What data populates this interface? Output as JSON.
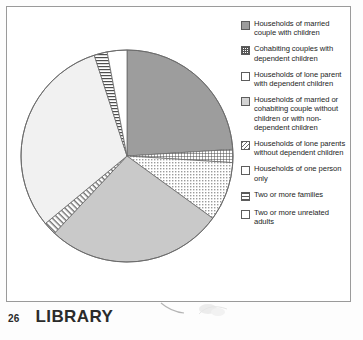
{
  "footer": {
    "page_number": "26",
    "section_title": "LIBRARY"
  },
  "legend": {
    "items": [
      {
        "pattern": "solid-dark",
        "icon": "solid-dark-swatch",
        "label": "Households of married couple with children"
      },
      {
        "pattern": "crosshatch",
        "icon": "crosshatch-swatch",
        "label": "Cohabiting couples with dependent children"
      },
      {
        "pattern": "dots",
        "icon": "dotted-swatch",
        "label": "Households of lone parent with dependent children"
      },
      {
        "pattern": "solid-light",
        "icon": "solid-light-swatch",
        "label": "Households of married or cohabiting couple without children or with non-dependent children"
      },
      {
        "pattern": "diagonal",
        "icon": "diagonal-hatch-swatch",
        "label": "Households of lone parents without dependent children"
      },
      {
        "pattern": "empty",
        "icon": "empty-swatch",
        "label": "Households of one person only"
      },
      {
        "pattern": "hstripe",
        "icon": "horizontal-stripe-swatch",
        "label": "Two or more families"
      },
      {
        "pattern": "empty",
        "icon": "empty-swatch",
        "label": "Two or more unrelated adults"
      }
    ]
  },
  "chart_data": {
    "type": "pie",
    "title": "",
    "legend_position": "right",
    "start_angle_deg": 0,
    "direction": "clockwise",
    "categories": [
      "Households of married couple with children",
      "Cohabiting couples with dependent children",
      "Households of lone parent with dependent children",
      "Households of married or cohabiting couple without children or with non-dependent children",
      "Households of lone parents without dependent children",
      "Households of one person only",
      "Two or more families",
      "Two or more unrelated adults"
    ],
    "values": [
      24,
      2,
      9,
      27,
      2,
      31,
      2,
      3
    ],
    "units": "percent",
    "slices": [
      {
        "label": "Households of married couple with children",
        "value": 24,
        "pattern": "solid-dark",
        "fill": "#9d9d9d"
      },
      {
        "label": "Cohabiting couples with dependent children",
        "value": 2,
        "pattern": "crosshatch",
        "fill": "#ffffff"
      },
      {
        "label": "Households of lone parent with dependent children",
        "value": 9,
        "pattern": "dots",
        "fill": "#ffffff"
      },
      {
        "label": "Households of married or cohabiting couple without children or with non-dependent children",
        "value": 27,
        "pattern": "solid-light",
        "fill": "#c9c9c9"
      },
      {
        "label": "Households of lone parents without dependent children",
        "value": 2,
        "pattern": "diagonal",
        "fill": "#ffffff"
      },
      {
        "label": "Households of one person only",
        "value": 31,
        "pattern": "empty",
        "fill": "#f0f0f0"
      },
      {
        "label": "Two or more families",
        "value": 2,
        "pattern": "hstripe",
        "fill": "#ffffff"
      },
      {
        "label": "Two or more unrelated adults",
        "value": 3,
        "pattern": "empty",
        "fill": "#ffffff"
      }
    ]
  }
}
